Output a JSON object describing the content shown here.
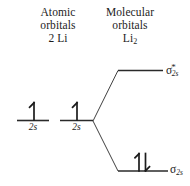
{
  "diagram": {
    "background_color": "#ffffff",
    "stroke_color": "#2a2a2a",
    "text_color": "#1c1c1c"
  },
  "headings": {
    "atomic": {
      "line1": "Atomic",
      "line2": "orbitals",
      "line3_prefix": "2 Li",
      "full": "Atomic orbitals 2 Li"
    },
    "molecular": {
      "line1": "Molecular",
      "line2": "orbitals",
      "line3_symbol": "Li",
      "line3_subscript": "2",
      "full": "Molecular orbitals Li2"
    }
  },
  "atomic_orbitals": [
    {
      "id": "ao-left",
      "sublabel": "2s",
      "electrons": "up",
      "electron_count": 1,
      "x1": 17,
      "x2": 49,
      "y": 120
    },
    {
      "id": "ao-right",
      "sublabel": "2s",
      "electrons": "up",
      "electron_count": 1,
      "x1": 60,
      "x2": 93,
      "y": 120
    }
  ],
  "molecular_orbitals": [
    {
      "id": "sigma-2s-star",
      "label_symbol": "σ",
      "label_superscript": "*",
      "label_subscript": "2s",
      "label_full": "σ*2s",
      "type": "antibonding",
      "electrons": "none",
      "electron_count": 0,
      "x1": 118,
      "x2": 163,
      "y": 70
    },
    {
      "id": "sigma-2s",
      "label_symbol": "σ",
      "label_superscript": "",
      "label_subscript": "2s",
      "label_full": "σ2s",
      "type": "bonding",
      "electrons": "up-down",
      "electron_count": 2,
      "x1": 118,
      "x2": 168,
      "y": 171
    }
  ],
  "correlation_lines": {
    "vertex_x": 93,
    "vertex_y": 121,
    "upper_end_x": 118,
    "upper_end_y": 70,
    "lower_end_x": 118,
    "lower_end_y": 171
  }
}
